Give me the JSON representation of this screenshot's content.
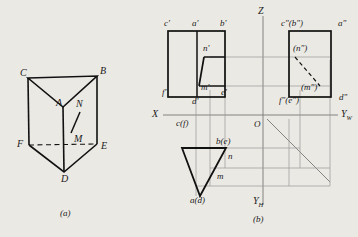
{
  "figure": {
    "caption_a": "(a)",
    "caption_b": "(b)",
    "background_color": "#ebe9e4",
    "line_color": "#111111",
    "thin_line_color": "#8a8a8a"
  },
  "pictorial": {
    "title": "triangular prism pictorial view",
    "vertices": [
      {
        "id": "C",
        "label": "C",
        "x": 22,
        "y": 74
      },
      {
        "id": "B",
        "label": "B",
        "x": 95,
        "y": 72
      },
      {
        "id": "A",
        "label": "A",
        "x": 58,
        "y": 103
      },
      {
        "id": "F",
        "label": "F",
        "x": 22,
        "y": 140
      },
      {
        "id": "E",
        "label": "E",
        "x": 95,
        "y": 143
      },
      {
        "id": "D",
        "label": "D",
        "x": 60,
        "y": 170
      },
      {
        "id": "N",
        "label": "N",
        "x": 73,
        "y": 105
      },
      {
        "id": "M",
        "label": "M",
        "x": 73,
        "y": 136
      }
    ],
    "labels": [
      "C",
      "B",
      "A",
      "N",
      "M",
      "F",
      "E",
      "D"
    ]
  },
  "projection": {
    "title": "three-view orthographic projection",
    "axes": {
      "x_label": "X",
      "z_label": "Z",
      "yh_label": "Y",
      "yh_sub": "H",
      "yw_label": "Y",
      "yw_sub": "W",
      "origin_label": "O"
    },
    "front_view": {
      "name": "V-projection front view",
      "labels": [
        {
          "text": "c'",
          "x": 165,
          "y": 26
        },
        {
          "text": "a'",
          "x": 194,
          "y": 26
        },
        {
          "text": "b'",
          "x": 221,
          "y": 26
        },
        {
          "text": "n'",
          "x": 206,
          "y": 49
        },
        {
          "text": "m'",
          "x": 205,
          "y": 88
        },
        {
          "text": "f'",
          "x": 165,
          "y": 93
        },
        {
          "text": "d'",
          "x": 196,
          "y": 101
        },
        {
          "text": "e'",
          "x": 224,
          "y": 93
        }
      ]
    },
    "side_view": {
      "name": "W-projection side view",
      "labels": [
        {
          "text": "c\"(b\")",
          "x": 284,
          "y": 26
        },
        {
          "text": "a\"",
          "x": 340,
          "y": 26
        },
        {
          "text": "(n\")",
          "x": 297,
          "y": 49
        },
        {
          "text": "(m\")",
          "x": 305,
          "y": 88
        },
        {
          "text": "f\"(e\")",
          "x": 283,
          "y": 100
        },
        {
          "text": "d\"",
          "x": 341,
          "y": 97
        }
      ]
    },
    "top_view": {
      "name": "H-projection top view",
      "labels": [
        {
          "text": "c(f)",
          "x": 180,
          "y": 124
        },
        {
          "text": "b(e)",
          "x": 219,
          "y": 142
        },
        {
          "text": "n",
          "x": 229,
          "y": 157
        },
        {
          "text": "m",
          "x": 219,
          "y": 177
        },
        {
          "text": "a(d)",
          "x": 196,
          "y": 200
        }
      ]
    }
  }
}
